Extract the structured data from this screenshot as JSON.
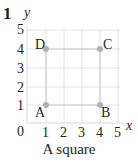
{
  "question_number": "1",
  "caption": "A square",
  "axes": {
    "x_label": "x",
    "y_label": "y",
    "x_ticks": [
      "1",
      "2",
      "3",
      "4",
      "5"
    ],
    "y_ticks": [
      "1",
      "2",
      "3",
      "4",
      "5"
    ],
    "origin_label": "0",
    "range": [
      0,
      5
    ]
  },
  "points": [
    {
      "label": "A",
      "x": 1,
      "y": 1
    },
    {
      "label": "B",
      "x": 4,
      "y": 1
    },
    {
      "label": "C",
      "x": 4,
      "y": 4
    },
    {
      "label": "D",
      "x": 1,
      "y": 4
    }
  ],
  "colors": {
    "grid": "#e0e0e0",
    "shape": "#c8c8c8",
    "point": "#b0b0b0",
    "text": "#231f20"
  }
}
